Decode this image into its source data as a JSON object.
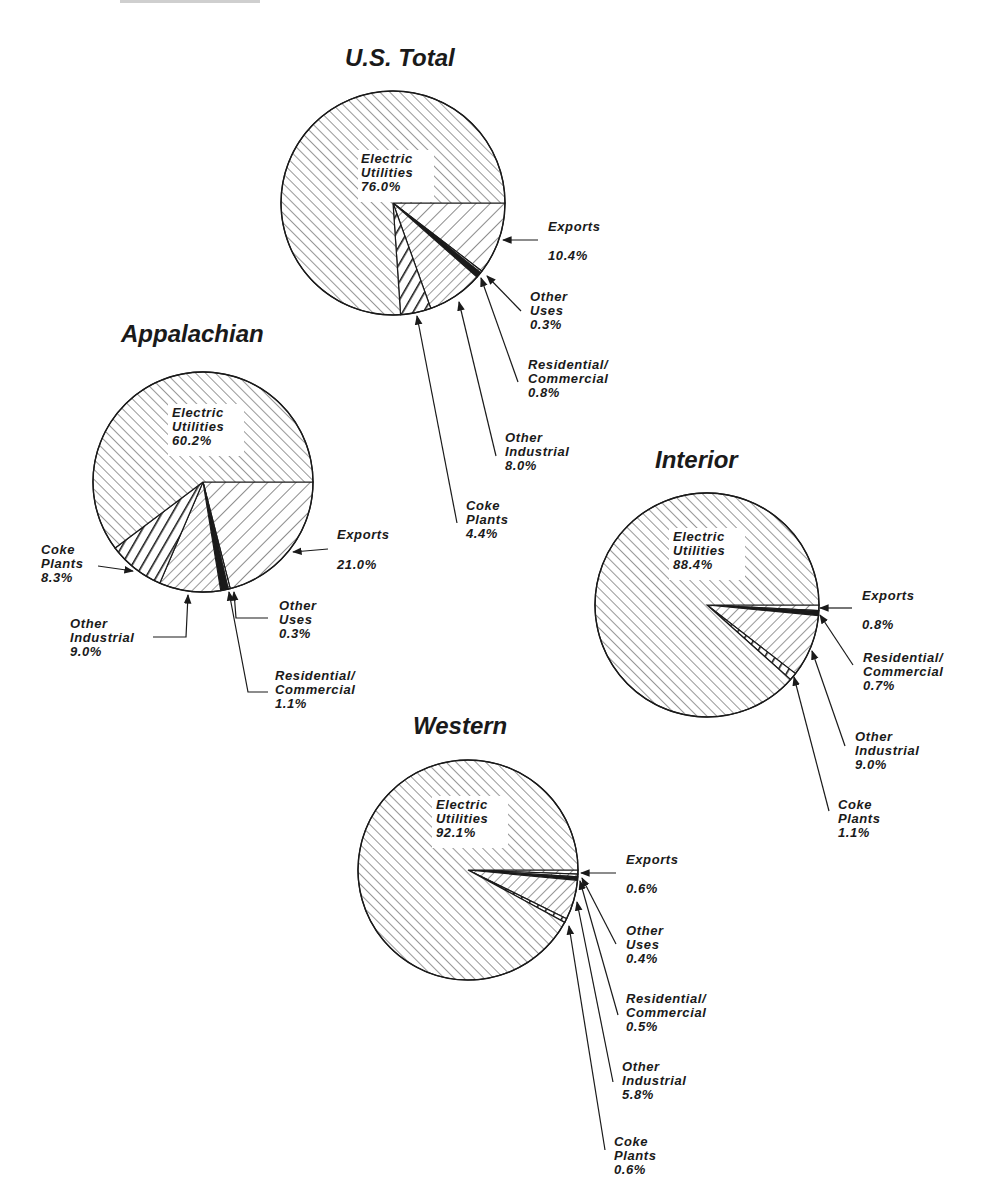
{
  "chart_data": [
    {
      "type": "pie",
      "title": "U.S. Total",
      "slices": [
        {
          "label": "Exports",
          "value": 10.4,
          "value_text": "10.4%"
        },
        {
          "label": "Other Uses",
          "value": 0.3,
          "value_text": "0.3%"
        },
        {
          "label": "Residential/ Commercial",
          "value": 0.8,
          "value_text": "0.8%"
        },
        {
          "label": "Other Industrial",
          "value": 8.0,
          "value_text": "8.0%"
        },
        {
          "label": "Coke Plants",
          "value": 4.4,
          "value_text": "4.4%"
        },
        {
          "label": "Electric Utilities",
          "value": 76.0,
          "value_text": "76.0%"
        }
      ]
    },
    {
      "type": "pie",
      "title": "Appalachian",
      "slices": [
        {
          "label": "Exports",
          "value": 21.0,
          "value_text": "21.0%"
        },
        {
          "label": "Other Uses",
          "value": 0.3,
          "value_text": "0.3%"
        },
        {
          "label": "Residential/ Commercial",
          "value": 1.1,
          "value_text": "1.1%"
        },
        {
          "label": "Other Industrial",
          "value": 9.0,
          "value_text": "9.0%"
        },
        {
          "label": "Coke Plants",
          "value": 8.3,
          "value_text": "8.3%"
        },
        {
          "label": "Electric Utilities",
          "value": 60.2,
          "value_text": "60.2%"
        }
      ]
    },
    {
      "type": "pie",
      "title": "Interior",
      "slices": [
        {
          "label": "Exports",
          "value": 0.8,
          "value_text": "0.8%"
        },
        {
          "label": "Residential/ Commercial",
          "value": 0.7,
          "value_text": "0.7%"
        },
        {
          "label": "Other Industrial",
          "value": 9.0,
          "value_text": "9.0%"
        },
        {
          "label": "Coke Plants",
          "value": 1.1,
          "value_text": "1.1%"
        },
        {
          "label": "Electric Utilities",
          "value": 88.4,
          "value_text": "88.4%"
        }
      ]
    },
    {
      "type": "pie",
      "title": "Western",
      "slices": [
        {
          "label": "Exports",
          "value": 0.6,
          "value_text": "0.6%"
        },
        {
          "label": "Other Uses",
          "value": 0.4,
          "value_text": "0.4%"
        },
        {
          "label": "Residential/ Commercial",
          "value": 0.5,
          "value_text": "0.5%"
        },
        {
          "label": "Other Industrial",
          "value": 5.8,
          "value_text": "5.8%"
        },
        {
          "label": "Coke Plants",
          "value": 0.6,
          "value_text": "0.6%"
        },
        {
          "label": "Electric Utilities",
          "value": 92.1,
          "value_text": "92.1%"
        }
      ]
    }
  ],
  "patterns": {
    "Electric Utilities": "fine-diagonal-up",
    "Exports": "medium-diagonal-down",
    "Other Uses": "dashed-light",
    "Residential/ Commercial": "dark-solid",
    "Other Industrial": "diagonal-down",
    "Coke Plants": "heavy-diagonal-down"
  },
  "colors": {
    "ink": "#1a1a1a",
    "paper": "#ffffff"
  }
}
